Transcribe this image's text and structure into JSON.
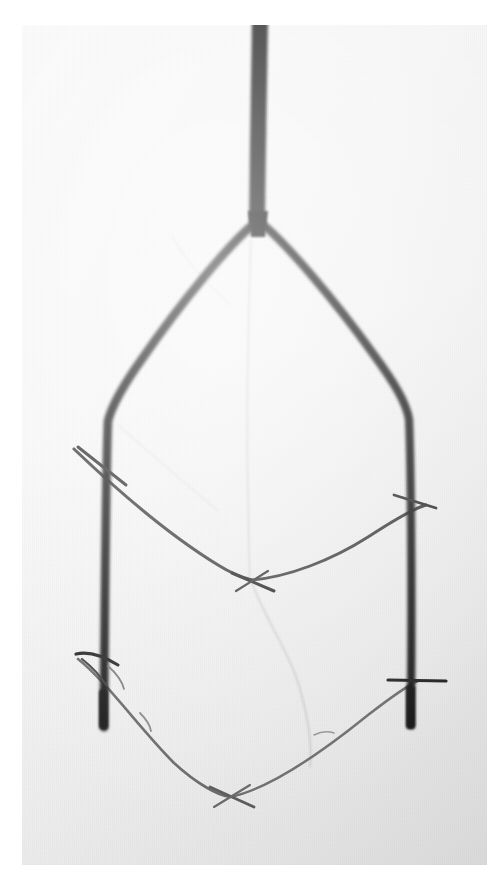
{
  "image": {
    "kind": "photograph",
    "subject": "forked-branch",
    "description": "Black and white photograph of a Y-shaped forked wooden branch with several thin crossing twigs tied between its two arms",
    "palette": {
      "paper_white": "#ffffff",
      "photo_background": "#f7f7f7",
      "branch_black": "#1a1a1a",
      "branch_soft_black": "#2b2b2b",
      "twig_gray": "#555555",
      "thread_faint": "#b9b9b9",
      "vignette_shadow": "#e6e6e6"
    },
    "frame": {
      "left": 22,
      "top": 25,
      "width": 465,
      "height": 840
    },
    "canvas": {
      "width": 504,
      "height": 889
    }
  },
  "objects": {
    "stem": {
      "label": "main-stem",
      "note": "Thick vertical trunk entering from the top edge",
      "top_point": [
        236,
        0
      ],
      "bottom_point": [
        236,
        196
      ],
      "width_px": 16
    },
    "fork": {
      "label": "fork-junction",
      "note": "Point where the trunk splits into two arms",
      "point": [
        236,
        198
      ]
    },
    "left_arm": {
      "label": "left-arm",
      "note": "Curves down-left from the fork then runs nearly vertical to a blunt tip",
      "bend_point": [
        82,
        395
      ],
      "tip_point": [
        80,
        703
      ]
    },
    "right_arm": {
      "label": "right-arm",
      "note": "Curves down-right from the fork then runs nearly vertical to a blunt tip",
      "bend_point": [
        388,
        392
      ],
      "tip_point": [
        389,
        700
      ]
    },
    "upper_crosspiece": {
      "label": "upper-crosspiece-twig",
      "note": "Thin twig sagging from upper left arm, through a knot node, rising to the right arm",
      "left_attach": [
        60,
        430
      ],
      "knot_node": [
        228,
        553
      ],
      "right_attach": [
        400,
        483
      ]
    },
    "lower_crosspiece": {
      "label": "lower-crosspiece-twig",
      "note": "Thin twig forming a shallow V between the two arm tips",
      "left_attach": [
        62,
        640
      ],
      "knot_node": [
        208,
        766
      ],
      "right_attach": [
        392,
        660
      ]
    },
    "left_upper_binding": {
      "label": "left-upper-binding-stub",
      "note": "Short diagonal stub crossing the left arm near the upper crosspiece"
    },
    "right_upper_binding": {
      "label": "right-upper-binding-stub",
      "note": "Short stub crossing the right arm near the upper crosspiece"
    },
    "left_lower_binding": {
      "label": "left-lower-binding-stub",
      "note": "Short stub crossing the left arm near the lower crosspiece"
    },
    "right_lower_binding": {
      "label": "right-lower-binding-stub",
      "note": "Short horizontal stub crossing the right arm near the lower crosspiece"
    },
    "faint_center_thread": {
      "label": "faint-center-thread",
      "note": "Very pale near-vertical filament running down the middle of the frame"
    },
    "faint_lower_thread": {
      "label": "faint-lower-thread",
      "note": "Pale filament descending from the upper knot node and curving right"
    }
  }
}
